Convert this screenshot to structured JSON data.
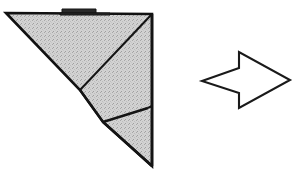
{
  "figure": {
    "caption": "",
    "background_color": "#ffffff",
    "paper_fill_color": "#d2d2d2",
    "paper_fill_speckle_color": "#9a9a9a",
    "outline_color": "#111111",
    "fold_line_color": "#141414",
    "arrow_fill_color": "#ffffff",
    "arrow_stroke_color": "#1a1a1a",
    "tab_fill_color": "#2a2a2a"
  },
  "model": {
    "name": "folded-paper-model",
    "outline_points": "6,13 152,14 152,166 103,122 80,90",
    "outline_stroke_width": 2.6,
    "body_points": "6,13 152,14 152,108 148,108 103,122 80,90",
    "flap_points": "103,122 148,108 152,112 152,166",
    "folds": [
      {
        "name": "diagonal-fold-main",
        "points": "152,14 80,90",
        "stroke_width": 2.0
      },
      {
        "name": "flap-edge-fold",
        "points": "103,122 148,108",
        "stroke_width": 2.4
      },
      {
        "name": "right-inner-edge-fold",
        "points": "148,108 152,106",
        "stroke_width": 2.2
      },
      {
        "name": "left-lower-edge-fold",
        "points": "80,90 103,122",
        "stroke_width": 2.2
      },
      {
        "name": "bottom-flap-lower-edge",
        "points": "103,122 152,166",
        "stroke_width": 2.4
      },
      {
        "name": "right-vertical-edge",
        "points": "152,14 152,166",
        "stroke_width": 2.6
      }
    ]
  },
  "tab": {
    "name": "top-raised-tab",
    "points": "62,13 62,9 96,9 96,13",
    "shadow_points": "60,13 110,13 110,15 60,15"
  },
  "arrow": {
    "name": "fold-direction-arrow",
    "direction": "right",
    "points": "202,81 239,68 239,52 290,80 239,108 239,93",
    "tail_tip": "202,81",
    "head_tip": "290,80"
  }
}
